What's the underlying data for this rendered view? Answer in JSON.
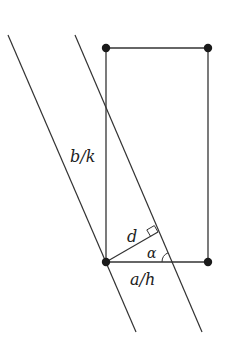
{
  "diagram": {
    "labels": {
      "side_left": "b/k",
      "perpendicular": "d",
      "angle": "α",
      "bottom": "a/h"
    },
    "colors": {
      "stroke": "#333333",
      "dot": "#1a1a1a",
      "background": "#ffffff"
    },
    "rectangle": {
      "corners": [
        [
          106,
          48
        ],
        [
          208,
          48
        ],
        [
          208,
          262
        ],
        [
          106,
          262
        ]
      ]
    },
    "parallel_lines": [
      {
        "from": [
          8,
          35
        ],
        "to": [
          136,
          332
        ]
      },
      {
        "from": [
          75,
          35
        ],
        "to": [
          202,
          332
        ]
      }
    ],
    "perpendicular_foot": [
      158,
      232
    ]
  }
}
